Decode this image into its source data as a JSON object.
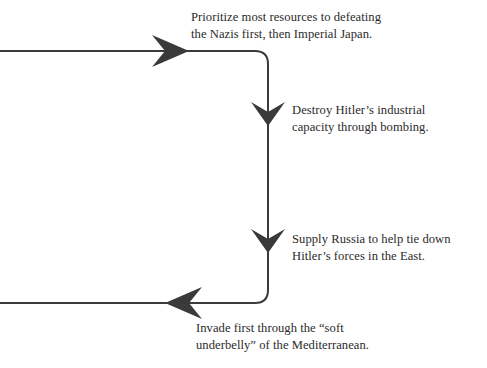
{
  "diagram": {
    "background_color": "#ffffff",
    "stroke_color": "#3a3a3a",
    "text_color": "#2b2b2b",
    "stroke_width": 2,
    "corner_radius": 13,
    "path": {
      "entry_x": 0,
      "top_line_y": 51,
      "vertical_x": 268,
      "bottom_line_y": 303,
      "exit_x": 0
    },
    "arrows": [
      {
        "name": "arrow-right-top",
        "direction": "right",
        "tip_x": 189,
        "tip_y": 51
      },
      {
        "name": "arrow-down-first",
        "direction": "down",
        "tip_x": 268,
        "tip_y": 126
      },
      {
        "name": "arrow-down-second",
        "direction": "down",
        "tip_x": 268,
        "tip_y": 253
      },
      {
        "name": "arrow-left-bottom",
        "direction": "left",
        "tip_x": 165,
        "tip_y": 303
      }
    ],
    "labels": {
      "prioritize": {
        "line1": "Prioritize most resources to defeating",
        "line2": "the Nazis first, then Imperial Japan."
      },
      "destroy": {
        "line1": "Destroy Hitler’s industrial",
        "line2": "capacity through bombing."
      },
      "supply": {
        "line1": "Supply Russia to help tie down",
        "line2": "Hitler’s forces in the East."
      },
      "invade": {
        "line1": "Invade first through the “soft",
        "line2": "underbelly” of the Mediterranean."
      }
    }
  }
}
